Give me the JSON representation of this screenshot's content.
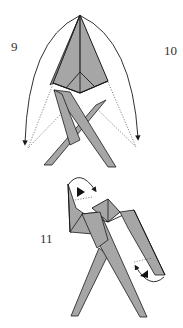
{
  "diagram": {
    "type": "origami-instructions",
    "steps": [
      {
        "number": "9",
        "label": "9",
        "action": "valley-fold left flap down"
      },
      {
        "number": "10",
        "label": "10",
        "action": "valley-fold right flap down"
      },
      {
        "number": "11",
        "label": "11",
        "action": "inside-reverse-fold tips of arms"
      }
    ],
    "colors": {
      "paper": "#a6a6a6",
      "stroke": "#1a1a1a",
      "background": "#ffffff",
      "dotted": "#555555"
    }
  }
}
